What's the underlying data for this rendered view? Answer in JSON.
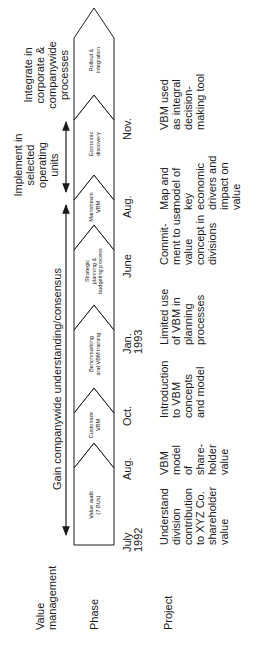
{
  "row_labels": {
    "value_management": [
      "Value",
      "management"
    ],
    "phase": "Phase",
    "project": "Project"
  },
  "value_management": {
    "gain": "Gain  companywide understanding/consensus",
    "implement": [
      "Implement in",
      "selected",
      "operating",
      "units"
    ],
    "integrate": [
      "Integrate in",
      "corporate &",
      "companywide",
      "processes"
    ]
  },
  "phases": [
    {
      "label": [
        "Value audit",
        "(7 BUs)"
      ]
    },
    {
      "label": [
        "Customize",
        "VBM"
      ]
    },
    {
      "label": [
        "Benchmarking",
        "and VBM training"
      ]
    },
    {
      "label": [
        "Strategic",
        "planning &",
        "budgeting process"
      ]
    },
    {
      "label": [
        "Mainstream",
        "VBM"
      ]
    },
    {
      "label": [
        "Economic",
        "discovery"
      ]
    },
    {
      "label": [
        "Rollout &",
        "integration"
      ]
    }
  ],
  "dates": [
    {
      "line1": "July",
      "line2": "1992"
    },
    {
      "line1": "Aug.",
      "line2": ""
    },
    {
      "line1": "Oct.",
      "line2": ""
    },
    {
      "line1": "Jan.",
      "line2": "1993"
    },
    {
      "line1": "June",
      "line2": ""
    },
    {
      "line1": "Aug.",
      "line2": ""
    },
    {
      "line1": "Nov.",
      "line2": ""
    }
  ],
  "projects": [
    "Understand\ndivision\ncontribution\nto XYZ Co.\nshareholder\nvalue",
    "VBM\nmodel\nof\nshare-\nholder\nvalue",
    "Introduction\nto VBM\nconcepts\nand model",
    "Limited use\nof VBM in\nplanning\nprocesses",
    "Commit-\nment to use\nvalue\nconcept in\ndivisions",
    "Map and\nmodel of\nkey\neconomic\ndrivers and\nimpact on\nvalue",
    "VBM used\nas integral\ndecision-\nmaking tool"
  ],
  "colors": {
    "stroke": "#1a1a1a",
    "text": "#1a1a1a",
    "background": "#ffffff"
  }
}
